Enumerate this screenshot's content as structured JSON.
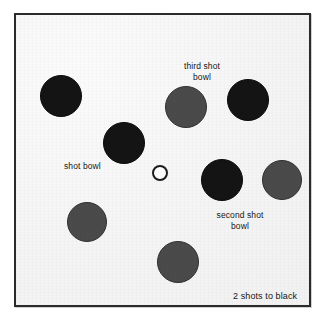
{
  "figure": {
    "caption": "2 shots to black",
    "background_color": "#f6f6f6",
    "border_color": "#2b2b2b",
    "frame": {
      "x": 14,
      "y": 13,
      "width": 297,
      "height": 294
    }
  },
  "colors": {
    "black_bowl": "#141414",
    "grey_bowl": "#4a4a4a",
    "jack_fill": "#ffffff",
    "jack_outline": "#1c1c1c",
    "text": "#161616"
  },
  "jack": {
    "name": "jack",
    "cx": 160,
    "cy": 173,
    "r": 8
  },
  "bowls": [
    {
      "id": "black-1",
      "color": "black",
      "cx": 61,
      "cy": 96,
      "r": 21
    },
    {
      "id": "black-2",
      "color": "black",
      "cx": 124,
      "cy": 143,
      "r": 21
    },
    {
      "id": "black-3",
      "color": "black",
      "cx": 248,
      "cy": 100,
      "r": 21
    },
    {
      "id": "black-4",
      "color": "black",
      "cx": 222,
      "cy": 180,
      "r": 21
    },
    {
      "id": "grey-1",
      "color": "grey",
      "cx": 186,
      "cy": 107,
      "r": 21
    },
    {
      "id": "grey-2",
      "color": "grey",
      "cx": 282,
      "cy": 180,
      "r": 20
    },
    {
      "id": "grey-3",
      "color": "grey",
      "cx": 87,
      "cy": 222,
      "r": 20
    },
    {
      "id": "grey-4",
      "color": "grey",
      "cx": 178,
      "cy": 262,
      "r": 21
    }
  ],
  "labels": {
    "third_shot_bowl": "third shot\nbowl",
    "third_shot_bowl_line1": "third shot",
    "third_shot_bowl_line2": "bowl",
    "shot_bowl": "shot bowl",
    "second_shot_bowl_line1": "second shot",
    "second_shot_bowl_line2": "bowl"
  }
}
